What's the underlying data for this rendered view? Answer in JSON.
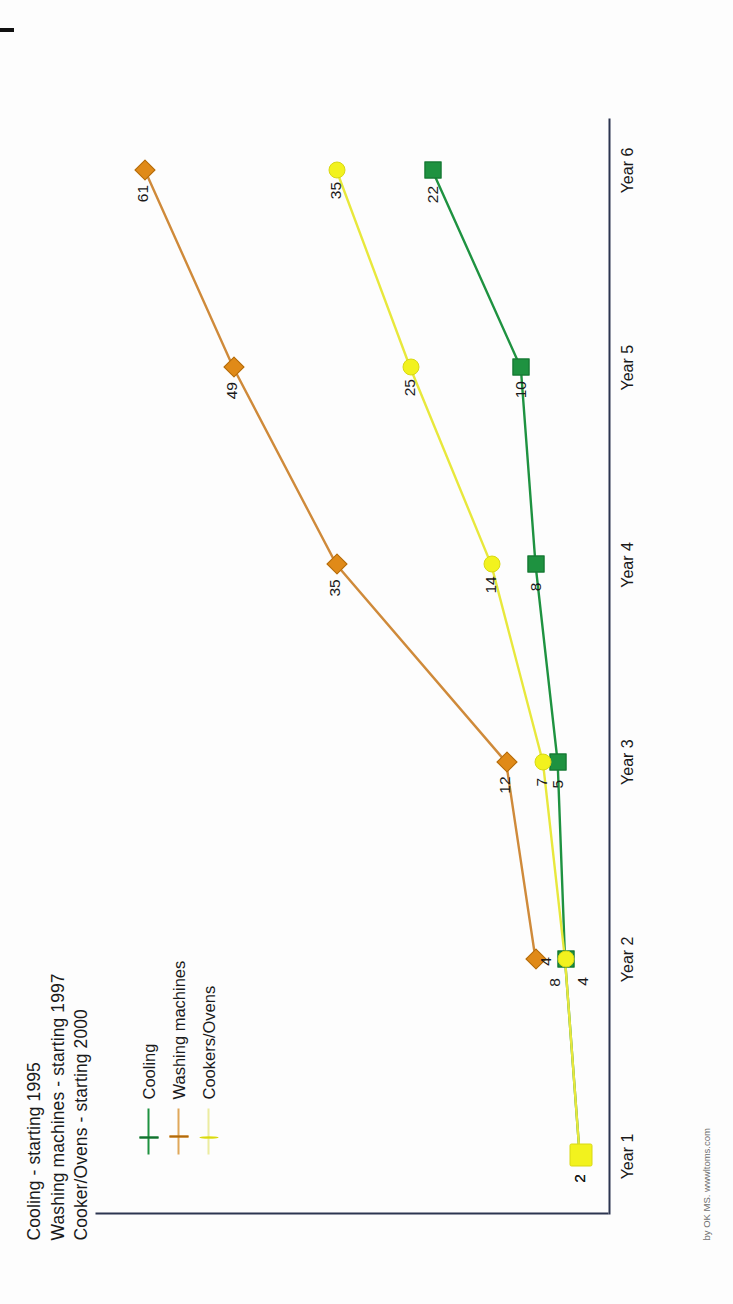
{
  "titles": [
    "Cooling - starting 1995",
    "Washing machines - starting 1997",
    "Cooker/Ovens - starting 2000"
  ],
  "credit": "by OK MS. wwwltoms.com",
  "legend": {
    "position": "left",
    "items": [
      {
        "label": "Cooling",
        "marker": "square-marker",
        "color": "#1e9240"
      },
      {
        "label": "Washing machines",
        "marker": "diamond-marker",
        "color": "#e08a18"
      },
      {
        "label": "Cookers/Ovens",
        "marker": "circle-marker",
        "color": "#f2f21e"
      }
    ]
  },
  "chart_data": {
    "type": "line",
    "xlabel": "",
    "ylabel": "",
    "grid": false,
    "legend_position": "left",
    "categories": [
      "Year 1",
      "Year 2",
      "Year 3",
      "Year 4",
      "Year 5",
      "Year 6"
    ],
    "ylim": [
      0,
      65
    ],
    "series": [
      {
        "name": "Cooling",
        "color": "#1e9240",
        "marker": "square-marker",
        "values": [
          2,
          4,
          5,
          8,
          10,
          22
        ],
        "labels": [
          "2",
          "4",
          "5",
          "8",
          "10",
          "22"
        ]
      },
      {
        "name": "Washing machines",
        "color": "#e08a18",
        "marker": "diamond-marker",
        "values": [
          null,
          8,
          12,
          35,
          49,
          61
        ],
        "labels": [
          "",
          "8",
          "12",
          "35",
          "49",
          "61"
        ]
      },
      {
        "name": "Cookers/Ovens",
        "color": "#f2f21e",
        "marker": "circle-marker",
        "values": [
          2,
          4,
          7,
          14,
          25,
          35
        ],
        "labels": [
          "2",
          "4",
          "7",
          "14",
          "25",
          "35"
        ]
      }
    ]
  }
}
